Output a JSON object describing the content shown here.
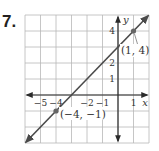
{
  "problem_number": "7.",
  "chart_data": {
    "type": "line",
    "title": "",
    "xlabel": "x",
    "ylabel": "y",
    "xlim": [
      -6,
      2
    ],
    "ylim": [
      -3,
      5
    ],
    "grid": true,
    "x_tick_labels": [
      "−5",
      "−4",
      "−2",
      "−1",
      "1"
    ],
    "x_tick_values": [
      -5,
      -4,
      -2,
      -1,
      1
    ],
    "y_tick_labels": [
      "1",
      "2",
      "4"
    ],
    "y_tick_values": [
      1,
      2,
      4
    ],
    "series": [
      {
        "name": "line",
        "equation": "y = x + 3",
        "slope": 1,
        "intercept": 3,
        "color": "#4a4a4a",
        "x": [
          -6,
          2
        ],
        "y": [
          -3,
          5
        ]
      }
    ],
    "points": [
      {
        "x": -4,
        "y": -1,
        "label": "(−4, −1)"
      },
      {
        "x": 1,
        "y": 4,
        "label": "(1, 4)"
      }
    ],
    "colors": {
      "grid": "#b8b8b8",
      "axis": "#2b2b2b",
      "line": "#4a4a4a",
      "point": "#666666"
    }
  }
}
